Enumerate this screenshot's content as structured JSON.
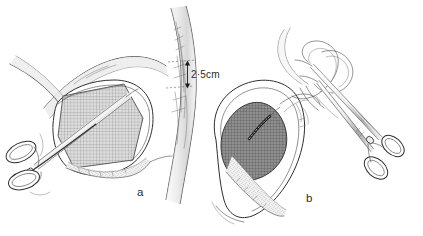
{
  "figure": {
    "background_color": "#ffffff",
    "ink_color": "#2f2f2f",
    "panels": [
      {
        "id": "a",
        "label": "a",
        "caption_position": "bottom-right",
        "description": "Open operative field with cross-hatched mesh graft in situ, retracted tissue flaps, vertical vessel at right, and a ring-handled clamp entering from lower left.",
        "elements": [
          "mesh-graft-patch",
          "tissue-flap-upper",
          "tissue-flap-left",
          "vessel-tube",
          "measurement-marker",
          "clamp-instrument",
          "stippled-tissue-edge"
        ]
      },
      {
        "id": "b",
        "label": "b",
        "caption_position": "bottom-right",
        "description": "Oval sac opened to reveal dark cross-hatched mesh with suture line, looped tubing above, and an angled ring-handled forceps from upper right.",
        "elements": [
          "sac-outline",
          "mesh-graft-dark",
          "suture-line",
          "tubing-loops",
          "forceps-instrument",
          "stippled-tissue-edge"
        ]
      }
    ],
    "annotations": {
      "dimension_label": "2·5cm",
      "dimension_value": 2.5,
      "dimension_unit": "cm",
      "dimension_marker": "double-arrow-vertical"
    },
    "palette": {
      "ink": "#2f2f2f",
      "ink_dark": "#141414",
      "mesh_light": "#9a9a9a",
      "mesh_dark": "#6b6b6b",
      "shade_light": "#ebebeb",
      "shade_mid": "#d6d6d6",
      "shade_deep": "#b9b9b9",
      "paper": "#ffffff"
    }
  }
}
